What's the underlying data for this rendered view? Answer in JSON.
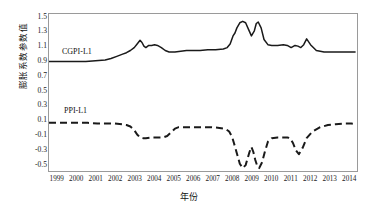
{
  "chart_data": {
    "type": "line",
    "title": "",
    "xlabel": "年份",
    "ylabel": "膨胀系数参数值",
    "ylim": [
      -0.6,
      1.55
    ],
    "xlim": [
      1999,
      2014.9
    ],
    "grid": false,
    "legend_position": "in-plot-annotation",
    "yticks": [
      "1.5",
      "1.3",
      "1.1",
      "0.9",
      "0.7",
      "0.5",
      "0.3",
      "0.1",
      "-0.1",
      "-0.3",
      "-0.5"
    ],
    "ytick_values": [
      1.5,
      1.3,
      1.1,
      0.9,
      0.7,
      0.5,
      0.3,
      0.1,
      -0.1,
      -0.3,
      -0.5
    ],
    "categories": [
      "1999",
      "2000",
      "2001",
      "2002",
      "2003",
      "2004",
      "2005",
      "2006",
      "2007",
      "2008",
      "2009",
      "2010",
      "2011",
      "2012",
      "2013",
      "2014"
    ],
    "series": [
      {
        "name": "CGPI-L1",
        "style": "solid",
        "color": "#1a1a1a",
        "x": [
          1999.0,
          1999.4,
          1999.9,
          2000.4,
          2000.9,
          2001.4,
          2001.9,
          2002.2,
          2002.5,
          2002.8,
          2003.0,
          2003.2,
          2003.4,
          2003.55,
          2003.7,
          2003.8,
          2003.9,
          2004.0,
          2004.15,
          2004.3,
          2004.45,
          2004.6,
          2004.8,
          2005.0,
          2005.2,
          2005.5,
          2005.8,
          2006.1,
          2006.4,
          2006.8,
          2007.2,
          2007.6,
          2008.0,
          2008.2,
          2008.35,
          2008.5,
          2008.6,
          2008.7,
          2008.85,
          2009.0,
          2009.15,
          2009.3,
          2009.45,
          2009.6,
          2009.7,
          2009.8,
          2009.95,
          2010.1,
          2010.3,
          2010.5,
          2010.8,
          2011.1,
          2011.3,
          2011.5,
          2011.7,
          2011.85,
          2012.0,
          2012.15,
          2012.3,
          2012.5,
          2012.8,
          2013.2,
          2013.6,
          2014.0,
          2014.4,
          2014.8
        ],
        "y": [
          0.9,
          0.9,
          0.9,
          0.9,
          0.9,
          0.91,
          0.92,
          0.94,
          0.97,
          1.0,
          1.02,
          1.05,
          1.09,
          1.14,
          1.19,
          1.16,
          1.11,
          1.09,
          1.12,
          1.12,
          1.13,
          1.12,
          1.09,
          1.05,
          1.03,
          1.03,
          1.04,
          1.05,
          1.05,
          1.05,
          1.06,
          1.06,
          1.07,
          1.09,
          1.14,
          1.25,
          1.29,
          1.36,
          1.43,
          1.45,
          1.43,
          1.34,
          1.25,
          1.32,
          1.42,
          1.44,
          1.36,
          1.2,
          1.13,
          1.12,
          1.12,
          1.13,
          1.12,
          1.09,
          1.12,
          1.11,
          1.09,
          1.13,
          1.21,
          1.13,
          1.05,
          1.03,
          1.03,
          1.03,
          1.03,
          1.03
        ]
      },
      {
        "name": "PPI-L1",
        "style": "dashed",
        "color": "#1a1a1a",
        "x": [
          1999.0,
          1999.5,
          2000.0,
          2000.5,
          2001.0,
          2001.5,
          2002.0,
          2002.4,
          2002.8,
          2003.0,
          2003.2,
          2003.4,
          2003.55,
          2003.7,
          2003.85,
          2004.0,
          2004.3,
          2004.6,
          2004.9,
          2005.1,
          2005.3,
          2005.5,
          2005.7,
          2005.9,
          2006.2,
          2006.6,
          2007.0,
          2007.4,
          2007.8,
          2008.0,
          2008.15,
          2008.3,
          2008.45,
          2008.55,
          2008.7,
          2008.85,
          2009.0,
          2009.15,
          2009.25,
          2009.35,
          2009.45,
          2009.55,
          2009.65,
          2009.75,
          2009.85,
          2010.0,
          2010.15,
          2010.3,
          2010.5,
          2010.8,
          2011.1,
          2011.3,
          2011.45,
          2011.6,
          2011.75,
          2011.9,
          2012.1,
          2012.3,
          2012.6,
          2013.0,
          2013.4,
          2013.8,
          2014.2,
          2014.6,
          2014.85
        ],
        "y": [
          0.06,
          0.06,
          0.06,
          0.06,
          0.06,
          0.05,
          0.05,
          0.05,
          0.04,
          0.03,
          0.01,
          -0.04,
          -0.1,
          -0.14,
          -0.15,
          -0.15,
          -0.14,
          -0.14,
          -0.14,
          -0.12,
          -0.07,
          -0.02,
          0.0,
          0.0,
          0.0,
          0.0,
          0.0,
          0.0,
          -0.01,
          -0.02,
          -0.03,
          -0.06,
          -0.13,
          -0.22,
          -0.36,
          -0.5,
          -0.56,
          -0.52,
          -0.43,
          -0.34,
          -0.27,
          -0.34,
          -0.45,
          -0.53,
          -0.56,
          -0.48,
          -0.33,
          -0.2,
          -0.15,
          -0.14,
          -0.14,
          -0.14,
          -0.15,
          -0.22,
          -0.32,
          -0.37,
          -0.28,
          -0.15,
          -0.06,
          0.0,
          0.03,
          0.04,
          0.05,
          0.05,
          0.04
        ]
      }
    ],
    "annotations": [
      {
        "text": "CGPI-L1",
        "x_px": 62,
        "y_px": 47
      },
      {
        "text": "PPI-L1",
        "x_px": 64,
        "y_px": 106
      }
    ]
  }
}
